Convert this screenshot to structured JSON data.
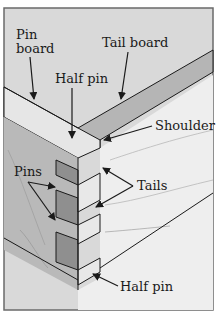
{
  "figure": {
    "labels": {
      "pin_board_line1": "Pin",
      "pin_board_line2": "board",
      "tail_board": "Tail board",
      "half_pin_top": "Half pin",
      "shoulder": "Shoulder",
      "pins": "Pins",
      "tails": "Tails",
      "half_pin_bottom": "Half pin"
    },
    "colors": {
      "background": "#d9d9d9",
      "frame": "#6a6a6a",
      "pin_board_top": "#e4e4e4",
      "tail_board_band": "#b5b5b5",
      "pin_face": "#9a9a9a",
      "tail_face": "#e8e8e8",
      "outline": "#1a1a1a",
      "grain": "#a8a8a8"
    }
  }
}
